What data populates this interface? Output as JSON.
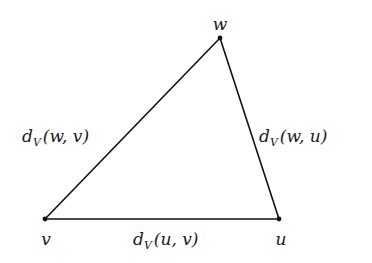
{
  "diagram": {
    "type": "triangle",
    "vertices": [
      {
        "id": "w",
        "label": "w",
        "x": 220,
        "y": 38,
        "label_x": 220,
        "label_y": 28
      },
      {
        "id": "v",
        "label": "v",
        "x": 45,
        "y": 219,
        "label_x": 46,
        "label_y": 245
      },
      {
        "id": "u",
        "label": "u",
        "x": 279,
        "y": 219,
        "label_x": 281,
        "label_y": 245
      }
    ],
    "edges": [
      {
        "from": "w",
        "to": "v",
        "label_d": "d",
        "label_sub": "V",
        "label_args": "(w, v)"
      },
      {
        "from": "w",
        "to": "u",
        "label_d": "d",
        "label_sub": "V",
        "label_args": "(w, u)"
      },
      {
        "from": "u",
        "to": "v",
        "label_d": "d",
        "label_sub": "V",
        "label_args": "(u, v)"
      }
    ],
    "colors": {
      "line": "#111111",
      "text": "#1a1a1a",
      "background": "#ffffff"
    }
  }
}
